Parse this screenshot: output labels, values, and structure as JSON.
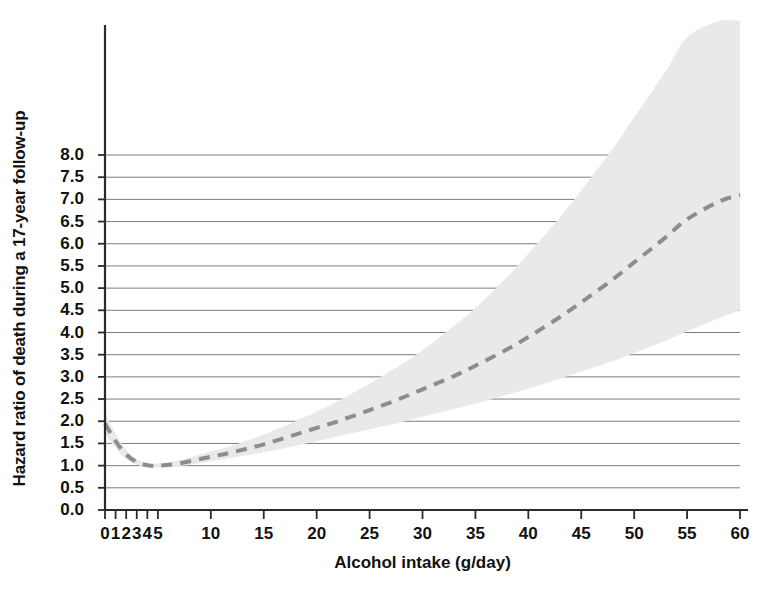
{
  "chart_data": {
    "type": "line",
    "title": "",
    "xlabel": "Alcohol intake (g/day)",
    "ylabel": "Hazard ratio of death during a 17-year follow-up",
    "xlim": [
      0,
      60
    ],
    "ylim": [
      0.0,
      8.0
    ],
    "grid": true,
    "legend": false,
    "xticks": [
      0,
      1,
      2,
      3,
      4,
      5,
      10,
      15,
      20,
      25,
      30,
      35,
      40,
      45,
      50,
      55,
      60
    ],
    "xticklabels": [
      "0",
      "1",
      "2",
      "3",
      "4",
      "5",
      "10",
      "15",
      "20",
      "25",
      "30",
      "35",
      "40",
      "45",
      "50",
      "55",
      "60"
    ],
    "yticks": [
      0.0,
      0.5,
      1.0,
      1.5,
      2.0,
      2.5,
      3.0,
      3.5,
      4.0,
      4.5,
      5.0,
      5.5,
      6.0,
      6.5,
      7.0,
      7.5,
      8.0
    ],
    "yticklabels": [
      "0.0",
      "0.5",
      "1.0",
      "1.5",
      "2.0",
      "2.5",
      "3.0",
      "3.5",
      "4.0",
      "4.5",
      "5.0",
      "5.5",
      "6.0",
      "6.5",
      "7.0",
      "7.5",
      "8.0"
    ],
    "series": [
      {
        "name": "Hazard ratio (dashed spline)",
        "style": "dashed",
        "color": "#8d8d8d",
        "x": [
          0,
          1,
          2,
          3,
          4,
          5,
          7,
          10,
          12,
          15,
          18,
          20,
          22,
          25,
          28,
          30,
          33,
          35,
          38,
          40,
          43,
          45,
          48,
          50,
          53,
          55,
          58,
          60
        ],
        "values": [
          1.95,
          1.55,
          1.25,
          1.08,
          1.01,
          1.0,
          1.05,
          1.2,
          1.3,
          1.48,
          1.7,
          1.85,
          2.0,
          2.25,
          2.52,
          2.72,
          3.02,
          3.25,
          3.62,
          3.9,
          4.35,
          4.68,
          5.2,
          5.58,
          6.15,
          6.55,
          6.95,
          7.1
        ]
      }
    ],
    "confidence_band": {
      "name": "95% confidence interval",
      "color": "#e9e9e9",
      "x": [
        0,
        1,
        2,
        3,
        4,
        5,
        7,
        10,
        12,
        15,
        18,
        20,
        22,
        25,
        28,
        30,
        33,
        35,
        38,
        40,
        43,
        45,
        48,
        50,
        53,
        55,
        58,
        60
      ],
      "upper": [
        2.2,
        1.72,
        1.36,
        1.15,
        1.06,
        1.05,
        1.12,
        1.32,
        1.45,
        1.7,
        2.0,
        2.22,
        2.45,
        2.85,
        3.28,
        3.6,
        4.15,
        4.55,
        5.25,
        5.78,
        6.6,
        7.2,
        8.15,
        8.85,
        9.9,
        10.65,
        11.6,
        12.2
      ],
      "lower": [
        1.72,
        1.4,
        1.15,
        1.02,
        0.97,
        0.96,
        0.99,
        1.1,
        1.18,
        1.3,
        1.45,
        1.55,
        1.66,
        1.82,
        1.98,
        2.1,
        2.28,
        2.4,
        2.6,
        2.74,
        2.96,
        3.12,
        3.36,
        3.54,
        3.82,
        4.02,
        4.32,
        4.5
      ]
    }
  },
  "axes": {
    "x_title": "Alcohol intake (g/day)",
    "y_title": "Hazard ratio of death during a 17-year follow-up"
  },
  "colors": {
    "curve": "#8d8d8d",
    "band": "#e9e9e9",
    "grid": "#6f6f6f",
    "axis": "#2b2b2b",
    "text": "#111111",
    "background": "#ffffff"
  }
}
